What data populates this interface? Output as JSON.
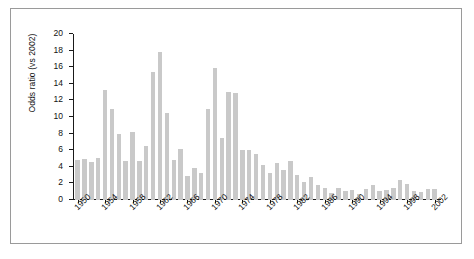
{
  "figure": {
    "name": "odds-ratio-by-year-bar-chart"
  },
  "chart_data": {
    "type": "bar",
    "title": "",
    "xlabel": "",
    "ylabel": "Odds ratio (vs 2002)",
    "ylim": [
      0,
      20
    ],
    "ytick_labels": [
      "0",
      "2",
      "4",
      "6",
      "8",
      "10",
      "12",
      "14",
      "16",
      "18",
      "20"
    ],
    "yticks": [
      0,
      2,
      4,
      6,
      8,
      10,
      12,
      14,
      16,
      18,
      20
    ],
    "xtick_labels": [
      "1950",
      "1954",
      "1958",
      "1962",
      "1966",
      "1970",
      "1974",
      "1978",
      "1982",
      "1986",
      "1990",
      "1994",
      "1998",
      "2002"
    ],
    "xticks": [
      1950,
      1954,
      1958,
      1962,
      1966,
      1970,
      1974,
      1978,
      1982,
      1986,
      1990,
      1994,
      1998,
      2002
    ],
    "grid": false,
    "legend": false,
    "bar_color": "#c9c9c9",
    "axis_color": "#1a1a1a",
    "categories": [
      1950,
      1951,
      1952,
      1953,
      1954,
      1955,
      1956,
      1957,
      1958,
      1959,
      1960,
      1961,
      1962,
      1963,
      1964,
      1965,
      1966,
      1967,
      1968,
      1969,
      1970,
      1971,
      1972,
      1973,
      1974,
      1975,
      1976,
      1977,
      1978,
      1979,
      1980,
      1981,
      1982,
      1983,
      1984,
      1985,
      1986,
      1987,
      1988,
      1989,
      1990,
      1991,
      1992,
      1993,
      1994,
      1995,
      1996,
      1997,
      1998,
      1999,
      2000,
      2001,
      2002
    ],
    "values": [
      4.8,
      5.0,
      4.6,
      5.1,
      13.3,
      11.0,
      8.0,
      4.7,
      8.2,
      4.7,
      6.5,
      15.4,
      17.8,
      10.5,
      4.8,
      6.1,
      2.9,
      3.9,
      3.3,
      11.0,
      15.9,
      7.5,
      13.0,
      12.9,
      6.0,
      6.0,
      5.6,
      4.2,
      3.2,
      4.4,
      3.6,
      4.7,
      3.0,
      2.2,
      2.8,
      1.8,
      1.4,
      0.9,
      1.5,
      1.1,
      1.2,
      0.7,
      1.3,
      1.8,
      1.1,
      1.2,
      1.4,
      2.4,
      1.9,
      1.1,
      1.0,
      1.3,
      1.3
    ]
  }
}
